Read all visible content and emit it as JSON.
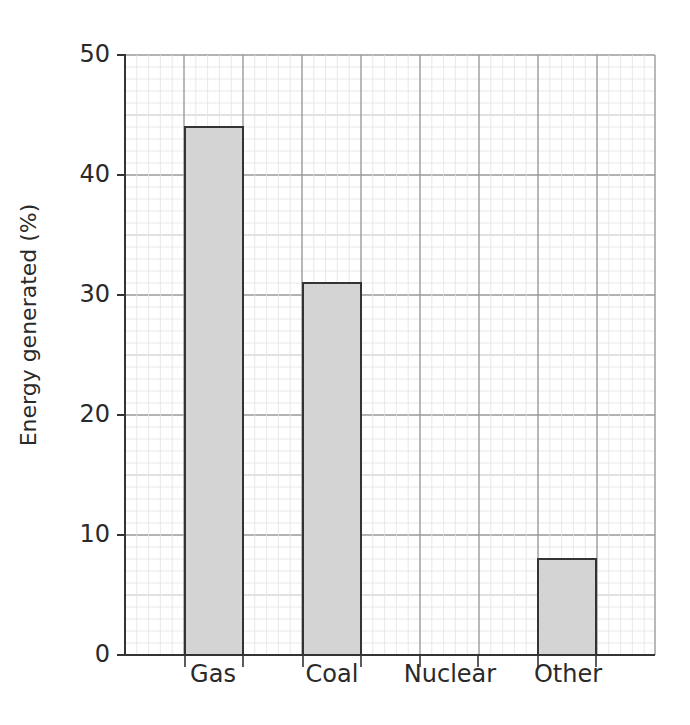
{
  "chart_data": {
    "type": "bar",
    "title": "",
    "xlabel": "",
    "ylabel": "Energy generated (%)",
    "categories": [
      "Gas",
      "Coal",
      "Nuclear",
      "Other"
    ],
    "values": [
      44,
      31,
      null,
      8
    ],
    "ylim": [
      0,
      50
    ],
    "yticks": [
      0,
      10,
      20,
      30,
      40,
      50
    ],
    "grid": true,
    "legend": null,
    "bar_color": "#d4d4d4",
    "bar_edge_color": "#333333",
    "grid_minor_color": "#e2e2e2",
    "grid_major_color": "#9a9a9a",
    "note": "Nuclear bar is not drawn (blank)"
  },
  "labels": {
    "ylabel": "Energy generated (%)",
    "yticks": [
      "0",
      "10",
      "20",
      "30",
      "40",
      "50"
    ],
    "categories": [
      "Gas",
      "Coal",
      "Nuclear",
      "Other"
    ]
  }
}
